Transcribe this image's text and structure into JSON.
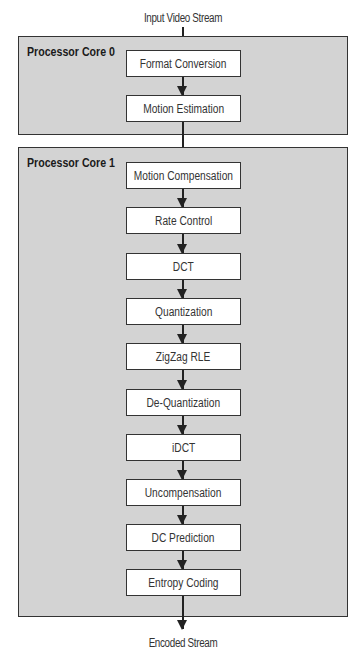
{
  "diagram": {
    "input_label": "Input Video Stream",
    "output_label": "Encoded Stream",
    "cores": [
      {
        "label": "Processor Core 0",
        "steps": [
          "Format Conversion",
          "Motion Estimation"
        ]
      },
      {
        "label": "Processor Core 1",
        "steps": [
          "Motion Compensation",
          "Rate Control",
          "DCT",
          "Quantization",
          "ZigZag RLE",
          "De-Quantization",
          "iDCT",
          "Uncompensation",
          "DC Prediction",
          "Entropy Coding"
        ]
      }
    ],
    "colors": {
      "core_fill": "#d3d3d3",
      "box_fill": "#ffffff",
      "border": "#333333"
    }
  }
}
